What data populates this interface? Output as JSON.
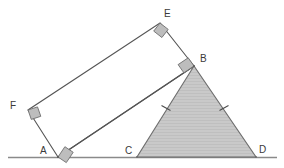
{
  "figure": {
    "canvas": {
      "width": 284,
      "height": 168
    },
    "colors": {
      "background": "#ffffff",
      "stroke": "#555555",
      "baseline": "#8a8a8a",
      "triangle_fill": "#c9c9c9",
      "triangle_stroke": "#6e6e6e",
      "rectangle_fill": "#ffffff",
      "right_angle_fill": "#bdbdbd",
      "right_angle_stroke": "#6e6e6e",
      "label_color": "#3a3a3a",
      "tick_color": "#4a4a4a"
    },
    "baseline": {
      "x1": 8,
      "y1": 157.5,
      "x2": 277,
      "y2": 157.5
    },
    "points": {
      "A": {
        "x": 58,
        "y": 157
      },
      "B": {
        "x": 194,
        "y": 66
      },
      "C": {
        "x": 137,
        "y": 157
      },
      "D": {
        "x": 256,
        "y": 157
      },
      "E": {
        "x": 160,
        "y": 23
      },
      "F": {
        "x": 28,
        "y": 110
      }
    },
    "rectangle": {
      "name": "rectangle-ABEF",
      "vertex_order": [
        "A",
        "B",
        "E",
        "F"
      ],
      "filled": false
    },
    "triangle": {
      "name": "triangle-BCD",
      "vertex_order": [
        "B",
        "C",
        "D"
      ],
      "filled": true,
      "congruent_sides": [
        "BC",
        "BD"
      ]
    },
    "right_angles": [
      {
        "at": "A",
        "size": 10
      },
      {
        "at": "B",
        "size": 10
      },
      {
        "at": "E",
        "size": 10
      },
      {
        "at": "F",
        "size": 10
      }
    ],
    "tick_marks": [
      {
        "on_segment": "BC",
        "x": 166,
        "y": 108,
        "count": 1
      },
      {
        "on_segment": "BD",
        "x": 224,
        "y": 108,
        "count": 1
      }
    ],
    "labels": [
      {
        "key": "A",
        "text": "A",
        "x": 40,
        "y": 146
      },
      {
        "key": "B",
        "text": "B",
        "x": 200,
        "y": 54
      },
      {
        "key": "C",
        "text": "C",
        "x": 125,
        "y": 146
      },
      {
        "key": "D",
        "text": "D",
        "x": 259,
        "y": 145
      },
      {
        "key": "E",
        "text": "E",
        "x": 164,
        "y": 9
      },
      {
        "key": "F",
        "text": "F",
        "x": 10,
        "y": 101
      }
    ]
  }
}
